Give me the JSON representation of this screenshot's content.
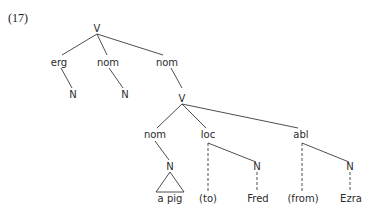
{
  "example_number": "(17)",
  "nodes": {
    "root_v": "V",
    "erg": "erg",
    "nom1": "nom",
    "nom2": "nom",
    "n_erg": "N",
    "n_nom1": "N",
    "v_inner": "V",
    "nom3": "nom",
    "loc": "loc",
    "abl": "abl",
    "n_nom3": "N",
    "n_loc": "N",
    "n_abl": "N"
  },
  "leaves": {
    "a_pig": "a pig",
    "to": "(to)",
    "fred": "Fred",
    "from": "(from)",
    "ezra": "Ezra"
  },
  "edges": [
    {
      "from": "root_v",
      "to": "erg",
      "style": "solid"
    },
    {
      "from": "root_v",
      "to": "nom1",
      "style": "solid"
    },
    {
      "from": "root_v",
      "to": "nom2",
      "style": "solid"
    },
    {
      "from": "erg",
      "to": "n_erg",
      "style": "solid"
    },
    {
      "from": "nom1",
      "to": "n_nom1",
      "style": "solid"
    },
    {
      "from": "nom2",
      "to": "v_inner",
      "style": "solid"
    },
    {
      "from": "v_inner",
      "to": "nom3",
      "style": "solid"
    },
    {
      "from": "v_inner",
      "to": "loc",
      "style": "solid"
    },
    {
      "from": "v_inner",
      "to": "abl",
      "style": "solid"
    },
    {
      "from": "nom3",
      "to": "n_nom3",
      "style": "solid"
    },
    {
      "from": "n_nom3",
      "to": "a_pig",
      "style": "triangle"
    },
    {
      "from": "loc",
      "to": "to",
      "style": "dashed"
    },
    {
      "from": "loc",
      "to": "n_loc",
      "style": "solid"
    },
    {
      "from": "n_loc",
      "to": "fred",
      "style": "dashed"
    },
    {
      "from": "abl",
      "to": "from",
      "style": "dashed"
    },
    {
      "from": "abl",
      "to": "n_abl",
      "style": "solid"
    },
    {
      "from": "n_abl",
      "to": "ezra",
      "style": "dashed"
    }
  ]
}
